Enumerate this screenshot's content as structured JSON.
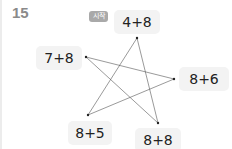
{
  "question": {
    "number": "15"
  },
  "start_badge": {
    "label": "시작"
  },
  "nodes": [
    {
      "id": "top",
      "label": "4+8"
    },
    {
      "id": "left",
      "label": "7+8"
    },
    {
      "id": "right",
      "label": "8+6"
    },
    {
      "id": "bottom_left",
      "label": "8+5"
    },
    {
      "id": "bottom_right",
      "label": "8+8"
    }
  ],
  "connections": [
    [
      "top",
      "bottom_left"
    ],
    [
      "top",
      "bottom_right"
    ],
    [
      "left",
      "right"
    ],
    [
      "left",
      "bottom_right"
    ],
    [
      "right",
      "bottom_left"
    ]
  ]
}
